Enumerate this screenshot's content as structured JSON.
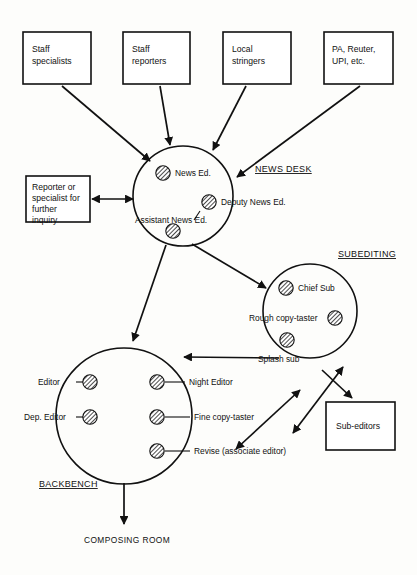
{
  "diagram": {
    "colors": {
      "ink": "#111111",
      "paper": "#ffffff",
      "hatch": "#111111"
    },
    "sources": [
      {
        "id": "staff-specialists",
        "lines": [
          "Staff",
          "specialists"
        ]
      },
      {
        "id": "staff-reporters",
        "lines": [
          "Staff",
          "reporters"
        ]
      },
      {
        "id": "local-stringers",
        "lines": [
          "Local",
          "stringers"
        ]
      },
      {
        "id": "agencies",
        "lines": [
          "PA, Reuter,",
          "UPI, etc."
        ]
      }
    ],
    "feedback_box": {
      "id": "reporter-or-specialist",
      "lines": [
        "Reporter or",
        "specialist for",
        "further",
        "inquiry"
      ]
    },
    "sub_editors_box": {
      "id": "sub-editors",
      "lines": [
        "Sub-editors"
      ]
    },
    "sections": [
      {
        "id": "news-desk",
        "label": "NEWS DESK"
      },
      {
        "id": "subediting",
        "label": "SUBEDITING"
      },
      {
        "id": "backbench",
        "label": "BACKBENCH"
      }
    ],
    "news_desk_roles": [
      {
        "id": "news-editor",
        "label": "News Ed."
      },
      {
        "id": "deputy-news-editor",
        "label": "Deputy News Ed."
      },
      {
        "id": "assistant-news-editor",
        "label": "Assistant News Ed."
      }
    ],
    "subediting_roles": [
      {
        "id": "chief-sub",
        "label": "Chief Sub"
      },
      {
        "id": "rough-copy-taster",
        "label": "Rough copy-taster"
      },
      {
        "id": "splash-sub",
        "label": "Splash sub"
      }
    ],
    "backbench_roles_left": [
      {
        "id": "editor",
        "label": "Editor"
      },
      {
        "id": "dep-editor",
        "label": "Dep. Editor"
      }
    ],
    "backbench_roles_right": [
      {
        "id": "night-editor",
        "label": "Night Editor"
      },
      {
        "id": "fine-copy-taster",
        "label": "Fine copy-taster"
      },
      {
        "id": "revise",
        "label": "Revise (associate editor)"
      }
    ],
    "terminal": {
      "id": "composing-room",
      "label": "COMPOSING ROOM"
    }
  }
}
